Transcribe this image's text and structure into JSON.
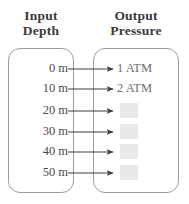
{
  "diagram": {
    "columns": {
      "input": {
        "line1": "Input",
        "line2": "Depth"
      },
      "output": {
        "line1": "Output",
        "line2": "Pressure"
      }
    },
    "rows": [
      {
        "depth": "0 m",
        "pressure": "1 ATM",
        "filled": true,
        "y": 69
      },
      {
        "depth": "10 m",
        "pressure": "2 ATM",
        "filled": true,
        "y": 89
      },
      {
        "depth": "20 m",
        "pressure": "",
        "filled": false,
        "y": 111
      },
      {
        "depth": "30 m",
        "pressure": "",
        "filled": false,
        "y": 132
      },
      {
        "depth": "40 m",
        "pressure": "",
        "filled": false,
        "y": 152
      },
      {
        "depth": "50 m",
        "pressure": "",
        "filled": false,
        "y": 173
      }
    ],
    "colors": {
      "border": "#9b9b9b",
      "heading_text": "#3a3a3a",
      "label_text": "#4a4a4a",
      "value_text": "#6e6e6e",
      "blank_fill": "#e9e9e9",
      "arrow": "#3f3f3f",
      "background": "#ffffff"
    }
  }
}
